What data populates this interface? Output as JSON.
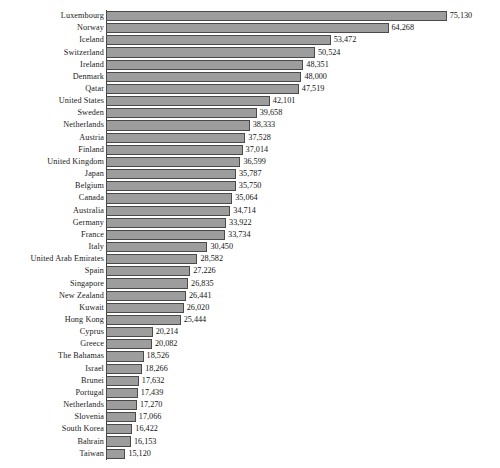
{
  "chart_data": {
    "type": "bar",
    "orientation": "horizontal",
    "title": "",
    "subtitle": "",
    "xlabel": "",
    "ylabel": "",
    "grid": false,
    "legend": false,
    "legend_position": "none",
    "axis_baseline_value": 11500,
    "xlim": [
      11500,
      76500
    ],
    "colors": {
      "bar_fill": "#9d9d9d",
      "bar_border": "#4a4a4a",
      "axis": "#3c3c3c",
      "text": "#141414",
      "background": "#ffffff"
    },
    "categories": [
      "Luxembourg",
      "Norway",
      "Iceland",
      "Switzerland",
      "Ireland",
      "Denmark",
      "Qatar",
      "United States",
      "Sweden",
      "Netherlands",
      "Austria",
      "Finland",
      "United Kingdom",
      "Japan",
      "Belgium",
      "Canada",
      "Australia",
      "Germany",
      "France",
      "Italy",
      "United Arab Emirates",
      "Spain",
      "Singapore",
      "New Zealand",
      "Kuwait",
      "Hong Kong",
      "Cyprus",
      "Greece",
      "The Bahamas",
      "Israel",
      "Brunei",
      "Portugal",
      "Netherlands",
      "Slovenia",
      "South Korea",
      "Bahrain",
      "Taiwan"
    ],
    "values": [
      75130,
      64268,
      53472,
      50524,
      48351,
      48000,
      47519,
      42101,
      39658,
      38333,
      37528,
      37014,
      36599,
      35787,
      35750,
      35064,
      34714,
      33922,
      33734,
      30450,
      28582,
      27226,
      26835,
      26441,
      26020,
      25444,
      20214,
      20082,
      18526,
      18266,
      17632,
      17439,
      17270,
      17066,
      16422,
      16153,
      15120
    ],
    "value_labels": [
      "75,130",
      "64,268",
      "53,472",
      "50,524",
      "48,351",
      "48,000",
      "47,519",
      "42,101",
      "39,658",
      "38,333",
      "37,528",
      "37,014",
      "36,599",
      "35,787",
      "35,750",
      "35,064",
      "34,714",
      "33,922",
      "33,734",
      "30,450",
      "28,582",
      "27,226",
      "26,835",
      "26,441",
      "26,020",
      "25,444",
      "20,214",
      "20,082",
      "18,526",
      "18,266",
      "17,632",
      "17,439",
      "17,270",
      "17,066",
      "16,422",
      "16,153",
      "15,120"
    ]
  }
}
